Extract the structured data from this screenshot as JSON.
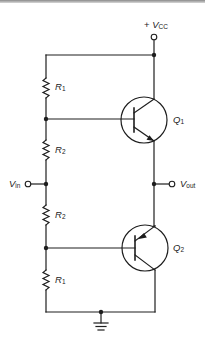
{
  "diagram": {
    "type": "circuit-schematic",
    "supply": {
      "label_prefix": "+",
      "label_main": "V",
      "label_sub": "CC"
    },
    "input": {
      "label_main": "V",
      "label_sub": "in"
    },
    "output": {
      "label_main": "V",
      "label_sub": "out"
    },
    "resistors": [
      {
        "id": "r1-top",
        "label_main": "R",
        "label_sub": "1"
      },
      {
        "id": "r2-top",
        "label_main": "R",
        "label_sub": "2"
      },
      {
        "id": "r2-bottom",
        "label_main": "R",
        "label_sub": "2"
      },
      {
        "id": "r1-bottom",
        "label_main": "R",
        "label_sub": "1"
      }
    ],
    "transistors": [
      {
        "id": "q1",
        "label_main": "Q",
        "label_sub": "1",
        "polarity": "NPN"
      },
      {
        "id": "q2",
        "label_main": "Q",
        "label_sub": "2",
        "polarity": "PNP"
      }
    ],
    "ground": {
      "icon": "ground-icon"
    },
    "colors": {
      "ink": "#1e1e1e",
      "background": "#ffffff"
    }
  }
}
